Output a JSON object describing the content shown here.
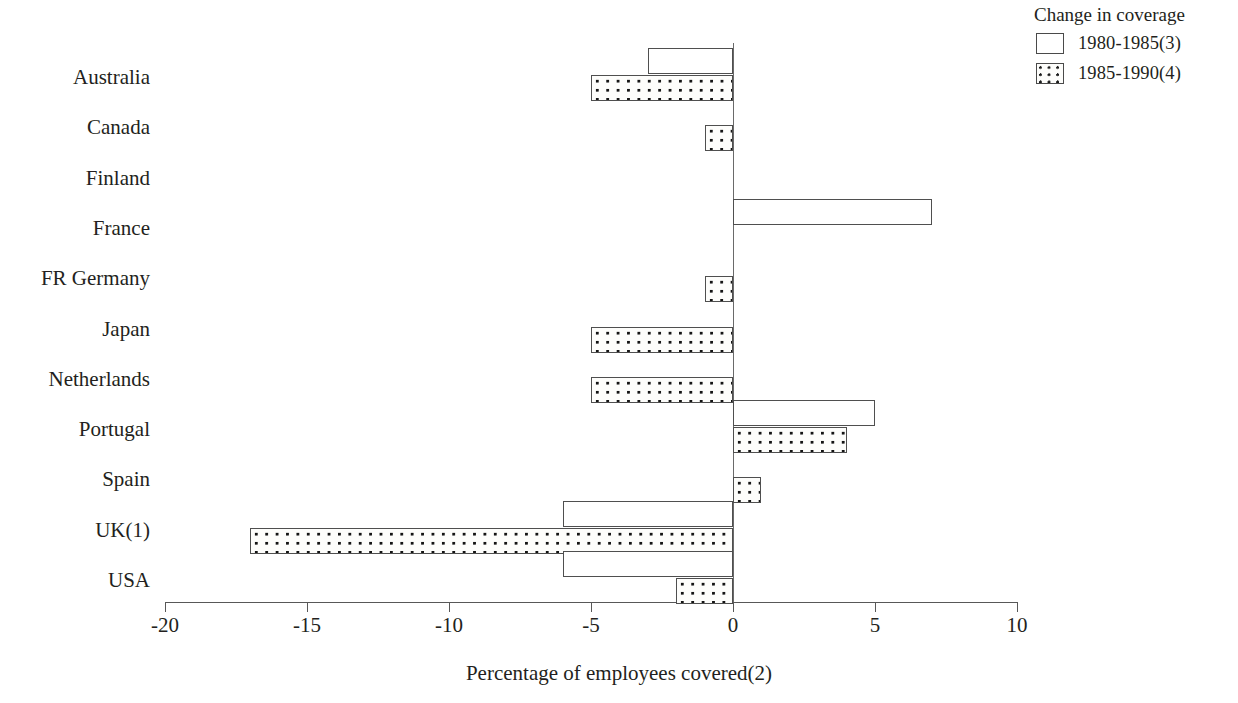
{
  "legend": {
    "title": "Change in coverage",
    "entries": [
      {
        "label": "1980-1985(3)",
        "swatch": "open-square-icon"
      },
      {
        "label": "1985-1990(4)",
        "swatch": "dotted-square-icon"
      }
    ]
  },
  "axis": {
    "x_title": "Percentage of  employees covered(2)",
    "ticks": [
      "-20",
      "-15",
      "-10",
      "-5",
      "0",
      "5",
      "10"
    ]
  },
  "chart_data": {
    "type": "bar",
    "orientation": "horizontal",
    "title": "",
    "xlabel": "Percentage of  employees covered(2)",
    "ylabel": "",
    "xlim": [
      -20,
      10
    ],
    "xticks": [
      -20,
      -15,
      -10,
      -5,
      0,
      5,
      10
    ],
    "grid": false,
    "legend_title": "Change in coverage",
    "legend_position": "top-right",
    "categories": [
      "Australia",
      "Canada",
      "Finland",
      "France",
      "FR Germany",
      "Japan",
      "Netherlands",
      "Portugal",
      "Spain",
      "UK(1)",
      "USA"
    ],
    "series": [
      {
        "name": "1980-1985(3)",
        "style": "open",
        "values": [
          -3,
          0,
          0,
          7,
          0,
          0,
          0,
          5,
          0,
          -6,
          -6
        ]
      },
      {
        "name": "1985-1990(4)",
        "style": "dotted",
        "values": [
          -5,
          -1,
          0,
          0,
          -1,
          -5,
          -5,
          4,
          1,
          -17,
          -2
        ]
      }
    ]
  }
}
